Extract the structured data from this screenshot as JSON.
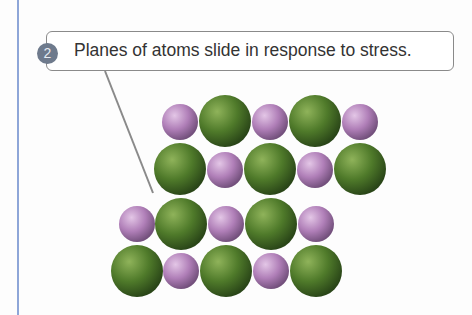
{
  "callout": {
    "step_number": "2",
    "text": "Planes of atoms slide in response to stress."
  },
  "colors": {
    "edge_line": "#8ea6d8",
    "callout_border": "#8a8a8a",
    "step_badge": "#6e7a8c",
    "large_atom": "#4f7a2a",
    "small_atom": "#b07fb8"
  },
  "atoms": {
    "upper_plane": [
      {
        "row": 1,
        "sequence": [
          "small",
          "large",
          "small",
          "large",
          "small"
        ]
      },
      {
        "row": 2,
        "sequence": [
          "large",
          "small",
          "large",
          "small",
          "large"
        ]
      }
    ],
    "lower_plane": [
      {
        "row": 3,
        "sequence": [
          "small",
          "large",
          "small",
          "large",
          "small"
        ]
      },
      {
        "row": 4,
        "sequence": [
          "large",
          "small",
          "large",
          "small",
          "large"
        ]
      }
    ]
  }
}
